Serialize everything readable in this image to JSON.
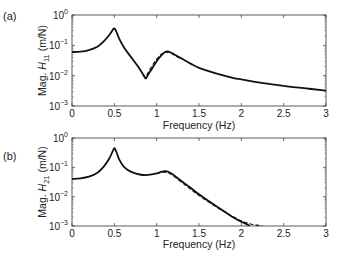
{
  "chart_data": [
    {
      "type": "line",
      "panel_label": "(a)",
      "title": "",
      "xlabel": "Frequency (Hz)",
      "ylabel_prefix": "Mag. ",
      "ylabel_sym": "H",
      "ylabel_sub": "11",
      "ylabel_suffix": " (m/N)",
      "xlim": [
        0,
        3
      ],
      "ylim": [
        0.001,
        1
      ],
      "yscale": "log",
      "xticks": [
        "0",
        "0.5",
        "1",
        "1.5",
        "2",
        "2.5",
        "3"
      ],
      "yticks": [
        {
          "base": "10",
          "exp": "0"
        },
        {
          "base": "10",
          "exp": "−1"
        },
        {
          "base": "10",
          "exp": "−2"
        },
        {
          "base": "10",
          "exp": "−3"
        }
      ],
      "grid": false,
      "legend": null,
      "series": [
        {
          "name": "measured",
          "style": "solid",
          "x": [
            0,
            0.1,
            0.2,
            0.3,
            0.38,
            0.44,
            0.48,
            0.5,
            0.52,
            0.56,
            0.62,
            0.7,
            0.78,
            0.84,
            0.87,
            0.9,
            0.95,
            1.0,
            1.05,
            1.1,
            1.14,
            1.2,
            1.3,
            1.4,
            1.5,
            1.7,
            1.9,
            2.0,
            2.2,
            2.5,
            2.8,
            3.0
          ],
          "y": [
            0.06,
            0.062,
            0.07,
            0.09,
            0.14,
            0.22,
            0.32,
            0.36,
            0.3,
            0.16,
            0.08,
            0.04,
            0.02,
            0.011,
            0.008,
            0.011,
            0.018,
            0.03,
            0.045,
            0.06,
            0.062,
            0.052,
            0.036,
            0.025,
            0.018,
            0.012,
            0.0085,
            0.0075,
            0.006,
            0.0046,
            0.0037,
            0.0032
          ]
        },
        {
          "name": "model",
          "style": "dashed",
          "x": [
            0.84,
            0.87,
            0.9,
            0.95,
            1.0,
            1.05,
            1.1,
            1.15,
            1.2,
            1.3
          ],
          "y": [
            0.011,
            0.009,
            0.013,
            0.022,
            0.035,
            0.05,
            0.058,
            0.058,
            0.049,
            0.034
          ]
        }
      ]
    },
    {
      "type": "line",
      "panel_label": "(b)",
      "title": "",
      "xlabel": "Frequency (Hz)",
      "ylabel_prefix": "Mag. ",
      "ylabel_sym": "H",
      "ylabel_sub": "21",
      "ylabel_suffix": " (m/N)",
      "xlim": [
        0,
        3
      ],
      "ylim": [
        0.001,
        1
      ],
      "yscale": "log",
      "xticks": [
        "0",
        "0.5",
        "1",
        "1.5",
        "2",
        "2.5",
        "3"
      ],
      "yticks": [
        {
          "base": "10",
          "exp": "0"
        },
        {
          "base": "10",
          "exp": "−1"
        },
        {
          "base": "10",
          "exp": "−2"
        },
        {
          "base": "10",
          "exp": "−3"
        }
      ],
      "grid": false,
      "legend": null,
      "series": [
        {
          "name": "measured",
          "style": "solid",
          "x": [
            0,
            0.1,
            0.2,
            0.3,
            0.38,
            0.44,
            0.48,
            0.5,
            0.52,
            0.56,
            0.62,
            0.7,
            0.8,
            0.9,
            1.0,
            1.05,
            1.1,
            1.15,
            1.2,
            1.3,
            1.4,
            1.5,
            1.6,
            1.7,
            1.8,
            1.9,
            2.0,
            2.05,
            2.1
          ],
          "y": [
            0.04,
            0.042,
            0.048,
            0.065,
            0.11,
            0.2,
            0.35,
            0.45,
            0.36,
            0.18,
            0.1,
            0.07,
            0.057,
            0.055,
            0.062,
            0.07,
            0.074,
            0.068,
            0.055,
            0.033,
            0.02,
            0.012,
            0.0075,
            0.0048,
            0.0031,
            0.002,
            0.0014,
            0.0012,
            0.001
          ]
        },
        {
          "name": "model",
          "style": "dashed",
          "x": [
            1.0,
            1.05,
            1.1,
            1.15,
            1.2,
            1.3,
            1.4,
            1.5,
            1.7,
            1.9,
            2.0,
            2.1,
            2.2,
            2.25
          ],
          "y": [
            0.06,
            0.066,
            0.068,
            0.062,
            0.05,
            0.03,
            0.018,
            0.011,
            0.0045,
            0.0021,
            0.0015,
            0.0012,
            0.00105,
            0.001
          ]
        }
      ]
    }
  ]
}
